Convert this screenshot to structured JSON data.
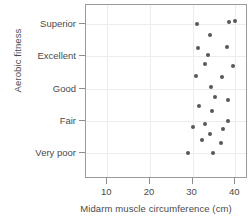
{
  "chart_data": {
    "type": "scatter",
    "title": "",
    "xlabel": "Midarm muscle circumference (cm)",
    "ylabel": "Aerobic fitness",
    "xlim": [
      5,
      43
    ],
    "xticks": [
      10,
      20,
      30,
      40
    ],
    "xticklabels": [
      "10",
      "20",
      "30",
      "40"
    ],
    "ycategories": [
      "Very poor",
      "Fair",
      "Good",
      "Excellent",
      "Superior"
    ],
    "yticklabels": [
      "Superior",
      "Excellent",
      "Good",
      "Fair",
      "Very poor"
    ],
    "grid": true,
    "legend": null,
    "marker_color": "#58585c",
    "points": [
      {
        "x": 31.0,
        "y": 5.0
      },
      {
        "x": 38.5,
        "y": 5.05
      },
      {
        "x": 40.0,
        "y": 5.1
      },
      {
        "x": 34.0,
        "y": 4.65
      },
      {
        "x": 31.2,
        "y": 4.25
      },
      {
        "x": 38.0,
        "y": 4.3
      },
      {
        "x": 33.5,
        "y": 4.05
      },
      {
        "x": 32.8,
        "y": 3.75
      },
      {
        "x": 39.5,
        "y": 3.7
      },
      {
        "x": 30.8,
        "y": 3.4
      },
      {
        "x": 37.0,
        "y": 3.35
      },
      {
        "x": 34.3,
        "y": 3.05
      },
      {
        "x": 35.2,
        "y": 2.75
      },
      {
        "x": 38.2,
        "y": 2.65
      },
      {
        "x": 31.6,
        "y": 2.45
      },
      {
        "x": 34.5,
        "y": 2.3
      },
      {
        "x": 38.3,
        "y": 2.0
      },
      {
        "x": 33.0,
        "y": 1.9
      },
      {
        "x": 30.0,
        "y": 1.8
      },
      {
        "x": 37.2,
        "y": 1.75
      },
      {
        "x": 34.0,
        "y": 1.6
      },
      {
        "x": 32.3,
        "y": 1.4
      },
      {
        "x": 36.6,
        "y": 1.3
      },
      {
        "x": 29.0,
        "y": 1.0
      },
      {
        "x": 34.8,
        "y": 1.0
      }
    ]
  }
}
